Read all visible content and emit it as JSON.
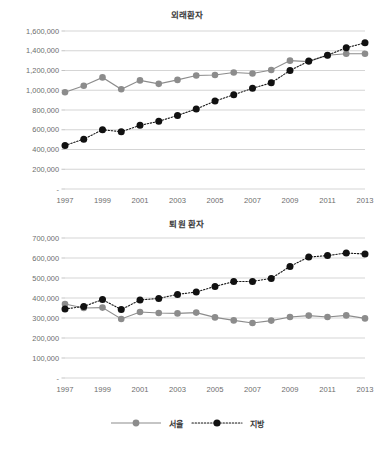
{
  "page": {
    "background": "#ffffff",
    "seoul_color": "#8c8c8c",
    "province_color": "#111111",
    "grid_color": "#b9b9b9"
  },
  "legend": {
    "seoul_label": "서울",
    "province_label": "지방"
  },
  "chart_data": [
    {
      "id": "outpatients",
      "type": "line",
      "title": "외래환자",
      "xlabel": "",
      "ylabel": "",
      "grid": true,
      "legend_position": "bottom",
      "x": [
        1997,
        1998,
        1999,
        2000,
        2001,
        2002,
        2003,
        2004,
        2005,
        2006,
        2007,
        2008,
        2009,
        2010,
        2011,
        2012,
        2013
      ],
      "xtick_labels": [
        "1997",
        "",
        "1999",
        "",
        "2001",
        "",
        "2003",
        "",
        "2005",
        "",
        "2007",
        "",
        "2009",
        "",
        "2011",
        "",
        "2013"
      ],
      "ytick_labels": [
        "-",
        "200,000",
        "400,000",
        "600,000",
        "800,000",
        "1,000,000",
        "1,200,000",
        "1,400,000",
        "1,600,000"
      ],
      "ytick_values": [
        0,
        200000,
        400000,
        600000,
        800000,
        1000000,
        1200000,
        1400000,
        1600000
      ],
      "ylim": [
        0,
        1600000
      ],
      "series": [
        {
          "name": "서울",
          "style": "solid",
          "color": "#8c8c8c",
          "values": [
            980000,
            1045000,
            1130000,
            1010000,
            1100000,
            1065000,
            1105000,
            1150000,
            1155000,
            1180000,
            1170000,
            1205000,
            1300000,
            1290000,
            1355000,
            1370000,
            1370000
          ]
        },
        {
          "name": "지방",
          "style": "dotted",
          "color": "#111111",
          "values": [
            440000,
            505000,
            600000,
            580000,
            645000,
            685000,
            745000,
            810000,
            890000,
            955000,
            1020000,
            1075000,
            1200000,
            1295000,
            1355000,
            1430000,
            1480000
          ]
        }
      ]
    },
    {
      "id": "discharged",
      "type": "line",
      "title": "퇴원 환자",
      "xlabel": "",
      "ylabel": "",
      "grid": true,
      "legend_position": "bottom",
      "x": [
        1997,
        1998,
        1999,
        2000,
        2001,
        2002,
        2003,
        2004,
        2005,
        2006,
        2007,
        2008,
        2009,
        2010,
        2011,
        2012,
        2013
      ],
      "xtick_labels": [
        "1997",
        "",
        "1999",
        "",
        "2001",
        "",
        "2003",
        "",
        "2005",
        "",
        "2007",
        "",
        "2009",
        "",
        "2011",
        "",
        "2013"
      ],
      "ytick_labels": [
        "-",
        "100,000",
        "200,000",
        "300,000",
        "400,000",
        "500,000",
        "600,000",
        "700,000"
      ],
      "ytick_values": [
        0,
        100000,
        200000,
        300000,
        400000,
        500000,
        600000,
        700000
      ],
      "ylim": [
        0,
        700000
      ],
      "series": [
        {
          "name": "서울",
          "style": "solid",
          "color": "#8c8c8c",
          "values": [
            370000,
            350000,
            352000,
            295000,
            330000,
            325000,
            323000,
            327000,
            303000,
            288000,
            275000,
            287000,
            305000,
            312000,
            305000,
            313000,
            298000
          ]
        },
        {
          "name": "지방",
          "style": "dotted",
          "color": "#111111",
          "values": [
            345000,
            358000,
            392000,
            342000,
            390000,
            398000,
            418000,
            430000,
            458000,
            482000,
            483000,
            498000,
            558000,
            605000,
            612000,
            625000,
            620000
          ]
        }
      ]
    }
  ]
}
